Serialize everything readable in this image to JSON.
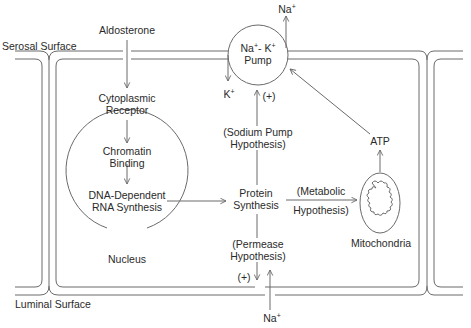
{
  "surfaces": {
    "serosal": "Serosal Surface",
    "luminal": "Luminal Surface"
  },
  "pathway": {
    "aldosterone": "Aldosterone",
    "cytoplasmic_receptor": [
      "Cytoplasmic",
      "Receptor"
    ],
    "chromatin_binding": [
      "Chromatin",
      "Binding"
    ],
    "dna_rna": [
      "DNA-Dependent",
      "RNA Synthesis"
    ],
    "nucleus": "Nucleus",
    "protein_synthesis": [
      "Protein",
      "Synthesis"
    ]
  },
  "pump": {
    "line1_base_na": "Na",
    "line1_sup_na": "+",
    "line1_sep": "- K",
    "line1_sup_k": "+",
    "line2": "Pump",
    "na_out_base": "Na",
    "na_out_sup": "+",
    "k_in_base": "K",
    "k_in_sup": "+",
    "stimulation": "(+)"
  },
  "hypotheses": {
    "sodium_pump": [
      "(Sodium Pump",
      "Hypothesis)"
    ],
    "metabolic": [
      "(Metabolic",
      "Hypothesis)"
    ],
    "permease": [
      "(Permease",
      "Hypothesis)"
    ]
  },
  "metabolic": {
    "atp": "ATP",
    "mitochondria": "Mitochondria"
  },
  "luminal_entry": {
    "stimulation": "(+)",
    "na_base": "Na",
    "na_sup": "+"
  },
  "colors": {
    "line": "#6a6a6a",
    "text": "#2a2a2a",
    "background": "#ffffff"
  }
}
